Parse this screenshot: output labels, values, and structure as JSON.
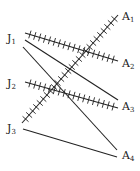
{
  "diagram": {
    "type": "bipartite-network",
    "stroke_color": "#222222",
    "left_nodes": [
      {
        "id": "J1",
        "base": "J",
        "sub": "1",
        "x": 7,
        "y": 33
      },
      {
        "id": "J2",
        "base": "J",
        "sub": "2",
        "x": 7,
        "y": 78
      },
      {
        "id": "J3",
        "base": "J",
        "sub": "3",
        "x": 7,
        "y": 123
      }
    ],
    "right_nodes": [
      {
        "id": "A1",
        "base": "A",
        "sub": "1",
        "x": 122,
        "y": 11
      },
      {
        "id": "A2",
        "base": "A",
        "sub": "2",
        "x": 122,
        "y": 58
      },
      {
        "id": "A3",
        "base": "A",
        "sub": "3",
        "x": 122,
        "y": 101
      },
      {
        "id": "A4",
        "base": "A",
        "sub": "4",
        "x": 122,
        "y": 150
      }
    ],
    "edges": [
      {
        "from": "J1",
        "to": "A2",
        "x1": 25,
        "y1": 33,
        "x2": 118,
        "y2": 61,
        "hatched": true,
        "ticks": 18
      },
      {
        "from": "J2",
        "to": "A3",
        "x1": 25,
        "y1": 82,
        "x2": 118,
        "y2": 108,
        "hatched": true,
        "ticks": 18
      },
      {
        "from": "J3",
        "to": "A1",
        "x1": 22,
        "y1": 123,
        "x2": 118,
        "y2": 15,
        "hatched": true,
        "ticks": 26
      },
      {
        "from": "J1",
        "to": "A3",
        "x1": 25,
        "y1": 40,
        "x2": 118,
        "y2": 100,
        "hatched": false
      },
      {
        "from": "J1",
        "to": "A4",
        "x1": 23,
        "y1": 47,
        "x2": 117,
        "y2": 150,
        "hatched": false
      },
      {
        "from": "J3",
        "to": "A4",
        "x1": 23,
        "y1": 129,
        "x2": 117,
        "y2": 157,
        "hatched": false
      }
    ]
  }
}
